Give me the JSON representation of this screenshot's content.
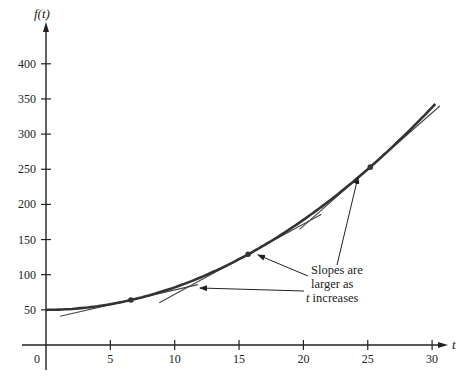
{
  "chart_data": {
    "type": "line",
    "title": "",
    "xlabel": "t",
    "ylabel": "f(t)",
    "xlim": [
      0,
      30
    ],
    "ylim": [
      0,
      420
    ],
    "x_ticks": [
      5,
      10,
      15,
      20,
      25,
      30
    ],
    "y_ticks": [
      50,
      100,
      150,
      200,
      250,
      300,
      350,
      400
    ],
    "origin_label": "0",
    "grid": false,
    "legend": null,
    "series": [
      {
        "name": "f(t)",
        "function_approx": "f(t) = 50 + 0.32 t^2",
        "x": [
          0,
          2,
          4,
          6,
          8,
          10,
          12,
          14,
          16,
          18,
          20,
          22,
          24,
          26,
          28,
          30
        ],
        "values": [
          50,
          51,
          55,
          62,
          70,
          82,
          96,
          113,
          132,
          154,
          178,
          205,
          234,
          266,
          301,
          338
        ]
      }
    ],
    "points": [
      {
        "t": 6.6,
        "f": 64,
        "slope": 4.2
      },
      {
        "t": 15.7,
        "f": 129,
        "slope": 10.0
      },
      {
        "t": 25.2,
        "f": 253,
        "slope": 16.1
      }
    ],
    "tangent_lines": [
      {
        "at_t": 6.6,
        "t_start": 1.1,
        "t_end": 11.8
      },
      {
        "at_t": 15.7,
        "t_start": 8.8,
        "t_end": 21.4
      },
      {
        "at_t": 25.2,
        "t_start": 19.7,
        "t_end": 30.6
      }
    ],
    "annotations": [
      {
        "lines": [
          "Slopes are",
          "larger as",
          "t increases"
        ],
        "arrows_to_t": [
          11.5,
          16.5,
          24.4
        ]
      }
    ]
  },
  "labels": {
    "y_axis_title": "f(t)",
    "x_axis_title": "t",
    "origin": "0",
    "annotation_line1": "Slopes are",
    "annotation_line2": "larger as",
    "annotation_line3_italic": "t",
    "annotation_line3_rest": " increases"
  }
}
